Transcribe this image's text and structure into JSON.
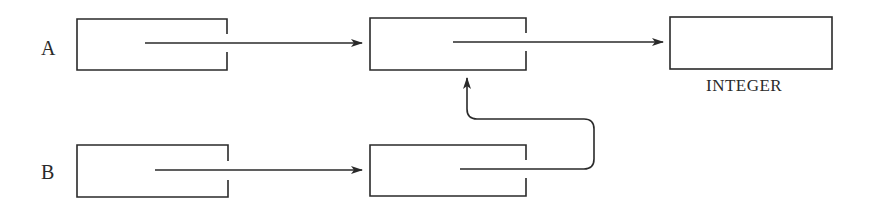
{
  "diagram": {
    "type": "pointer-diagram",
    "variables": [
      {
        "id": "A",
        "label": "A"
      },
      {
        "id": "B",
        "label": "B"
      }
    ],
    "nodes": [
      {
        "id": "a1",
        "row": "A",
        "kind": "pointer-cell"
      },
      {
        "id": "a2",
        "row": "A",
        "kind": "pointer-cell"
      },
      {
        "id": "int",
        "row": "A",
        "kind": "value-cell",
        "caption": "INTEGER"
      },
      {
        "id": "b1",
        "row": "B",
        "kind": "pointer-cell"
      },
      {
        "id": "b2",
        "row": "B",
        "kind": "pointer-cell"
      }
    ],
    "edges": [
      {
        "from": "a1",
        "to": "a2"
      },
      {
        "from": "a2",
        "to": "int"
      },
      {
        "from": "b1",
        "to": "b2"
      },
      {
        "from": "b2",
        "to": "a2"
      }
    ],
    "colors": {
      "stroke": "#2a2a2a",
      "background": "#ffffff"
    }
  },
  "labels": {
    "var_a": "A",
    "var_b": "B",
    "integer_caption": "INTEGER"
  }
}
